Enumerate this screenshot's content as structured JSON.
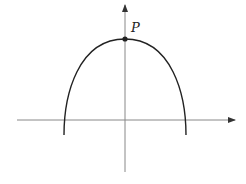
{
  "diagram": {
    "type": "coordinate-plot",
    "colors": {
      "axes": "#888888",
      "curve": "#222222",
      "point": "#222222"
    },
    "axes": {
      "x_axis": {
        "y": 120,
        "x_start": 17,
        "x_end": 235,
        "arrow": true
      },
      "y_axis": {
        "x": 125,
        "y_start": 172,
        "y_end": 5,
        "arrow": true
      }
    },
    "curve": {
      "vertex": [
        125,
        39
      ],
      "left_end": [
        64,
        135
      ],
      "right_end": [
        186,
        135
      ]
    },
    "point": {
      "label": "P",
      "x": 125,
      "y": 39
    }
  }
}
